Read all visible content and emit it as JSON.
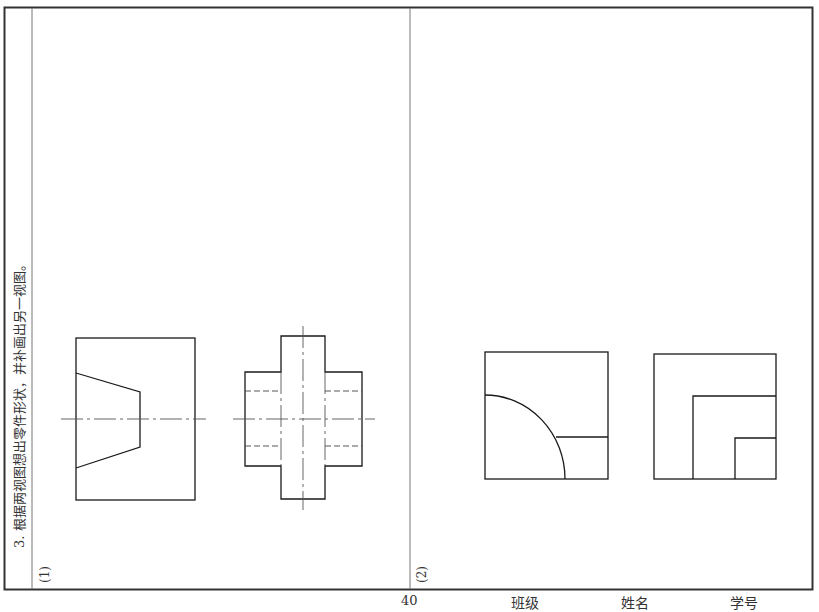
{
  "exercise": {
    "instruction": "3. 根据两视图想出零件形状，并补画出另一视图。",
    "part1_label": "(1)",
    "part2_label": "(2)"
  },
  "footer": {
    "page_number": "40",
    "class_label": "班级",
    "name_label": "姓名",
    "student_id_label": "学号"
  },
  "colors": {
    "line": "#1a1a1a",
    "frame": "#333333",
    "centerline": "#555555"
  }
}
